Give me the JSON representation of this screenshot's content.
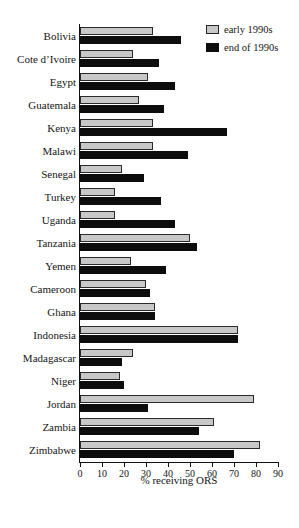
{
  "chart_data": {
    "type": "bar",
    "orientation": "horizontal",
    "title": "",
    "xlabel": "% receiving ORS",
    "ylabel": "",
    "xlim": [
      0,
      90
    ],
    "xticks": [
      0,
      10,
      20,
      30,
      40,
      50,
      60,
      70,
      80,
      90
    ],
    "grid": false,
    "legend_position": "top-right",
    "categories": [
      "Bolivia",
      "Cote d’Ivoire",
      "Egypt",
      "Guatemala",
      "Kenya",
      "Malawi",
      "Senegal",
      "Turkey",
      "Uganda",
      "Tanzania",
      "Yemen",
      "Cameroon",
      "Ghana",
      "Indonesia",
      "Madagascar",
      "Niger",
      "Jordan",
      "Zambia",
      "Zimbabwe"
    ],
    "series": [
      {
        "name": "early 1990s",
        "color": "#c8c8c8",
        "values": [
          33,
          24,
          31,
          27,
          33,
          33,
          19,
          16,
          16,
          50,
          23,
          30,
          34,
          72,
          24,
          18,
          79,
          61,
          82
        ]
      },
      {
        "name": "end of 1990s",
        "color": "#0d0d0d",
        "values": [
          46,
          36,
          43,
          38,
          67,
          49,
          29,
          37,
          43,
          53,
          39,
          32,
          34,
          72,
          19,
          20,
          31,
          54,
          70
        ]
      }
    ]
  },
  "legend": {
    "items": [
      {
        "label": "early 1990s"
      },
      {
        "label": "end of 1990s"
      }
    ]
  }
}
